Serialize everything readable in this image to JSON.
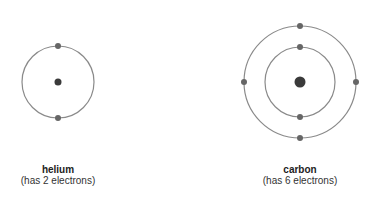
{
  "atoms": [
    {
      "name": "helium",
      "caption": "(has 2 electrons)",
      "electron_count": 2,
      "center": [
        58,
        82
      ],
      "nucleus_radius": 3.5,
      "shells": [
        {
          "radius": 36,
          "electrons": 2
        }
      ]
    },
    {
      "name": "carbon",
      "caption": "(has 6 electrons)",
      "electron_count": 6,
      "center": [
        300,
        82
      ],
      "nucleus_radius": 5.5,
      "shells": [
        {
          "radius": 35,
          "electrons": 2
        },
        {
          "radius": 56,
          "electrons": 4
        }
      ]
    }
  ],
  "colors": {
    "orbit": "#8a8a8a",
    "electron": "#666666",
    "nucleus": "#3a3a3a",
    "text": "#222222"
  }
}
